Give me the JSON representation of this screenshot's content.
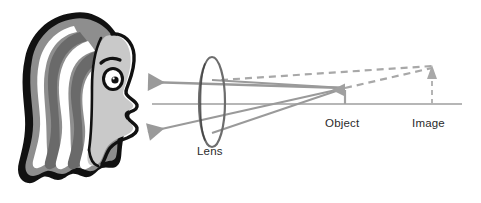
{
  "diagram": {
    "kind": "optics-ray-diagram",
    "background_color": "#ffffff",
    "labels": {
      "lens": "Lens",
      "object": "Object",
      "image": "Image"
    },
    "colors": {
      "ray": "#9a9a9a",
      "dashed_ray": "#a8a8a8",
      "axis": "#b0b0b0",
      "arrow": "#a0a0a0",
      "lens_outline": "#6d6d6d",
      "label_text": "#2b2b2b",
      "hair_outline": "#111111",
      "hair_mid": "#8e8e8e",
      "hair_dark": "#6a6a6a",
      "skin": "#c9c9c9",
      "white": "#ffffff"
    },
    "geometry": {
      "optical_axis_y": 104,
      "optical_axis_x_start": 152,
      "optical_axis_x_end": 462,
      "lens_center_x": 212,
      "lens_center_y": 102,
      "lens_rx": 13,
      "lens_ry": 45,
      "object_x": 345,
      "object_base_y": 104,
      "object_tip_y": 86,
      "image_x": 432,
      "image_base_y": 104,
      "image_tip_y": 66,
      "eye_x": 143,
      "eye_y": 82,
      "mouth_ray_end_x": 143,
      "mouth_ray_end_y": 133
    },
    "elements": {
      "head_description": "woman head profile facing right",
      "lens_shape": "vertical ellipse outline",
      "object_arrow": "solid upward arrow on axis",
      "image_arrow": "dashed upward arrow on axis, taller",
      "refracted_rays": 2,
      "virtual_ray_extensions": 2
    }
  }
}
